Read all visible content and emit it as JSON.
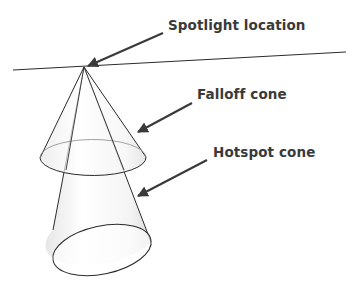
{
  "diagram": {
    "labels": {
      "spotlight_location": "Spotlight location",
      "falloff_cone": "Falloff cone",
      "hotspot_cone": "Hotspot cone"
    },
    "colors": {
      "line": "#2b2b2b",
      "text": "#3a3a3a",
      "arrow": "#3a3a3a",
      "cone_fill": "#f2f2f2"
    }
  }
}
